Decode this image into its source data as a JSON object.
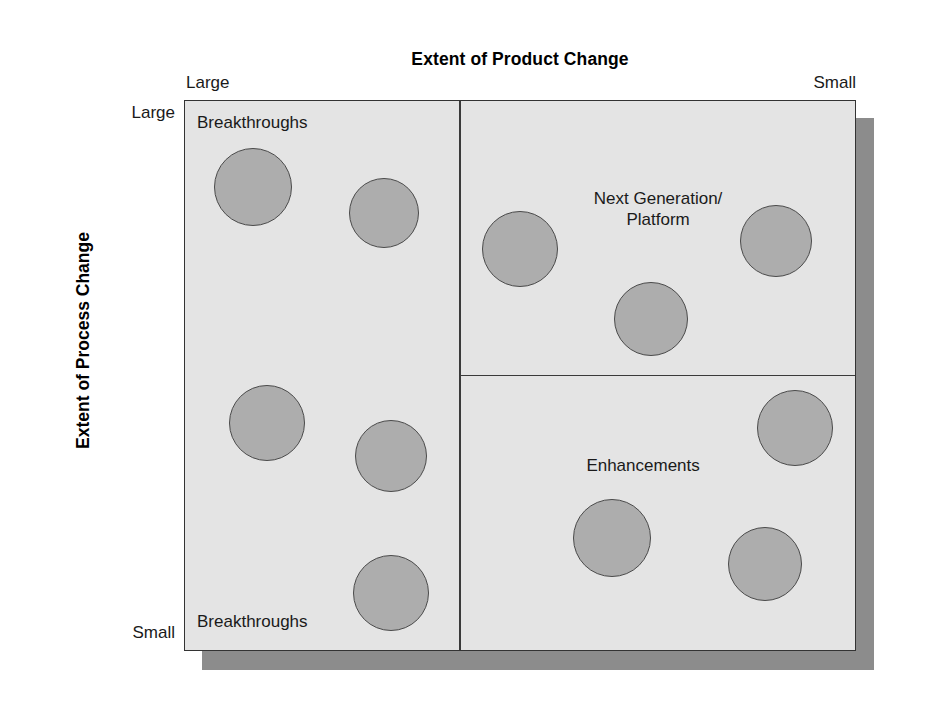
{
  "figure": {
    "background_color": "#ffffff",
    "frame_color": "#3a3a3a"
  },
  "axes": {
    "x": {
      "title": "Extent of Product Change",
      "left_label": "Large",
      "right_label": "Small"
    },
    "y": {
      "title": "Extent of Process Change",
      "top_label": "Large",
      "bottom_label": "Small"
    }
  },
  "matrix": {
    "background_color": "#e4e4e4",
    "border_color": "#333333",
    "shadow_color": "#8c8c8c",
    "vertical_divider_x_pct": 40.8,
    "horizontal_divider_y_pct": 49.7,
    "quadrants": [
      {
        "id": "top-left",
        "label": "Breakthroughs"
      },
      {
        "id": "top-right",
        "label": "Next Generation/\nPlatform"
      },
      {
        "id": "bottom-left",
        "label": "Breakthroughs"
      },
      {
        "id": "bottom-right",
        "label": "Enhancements"
      }
    ]
  },
  "chart_data": {
    "type": "scatter",
    "title": "Extent of Product Change",
    "xlabel": "Extent of Product Change",
    "ylabel": "Extent of Process Change",
    "xlim": [
      "Large",
      "Small"
    ],
    "ylim": [
      "Small",
      "Large"
    ],
    "grid": false,
    "legend": null,
    "annotations": [
      "Breakthroughs",
      "Next Generation/Platform",
      "Breakthroughs",
      "Enhancements"
    ],
    "marker_fill": "#adadad",
    "marker_stroke": "#4a4a4a",
    "points": [
      {
        "id": "p1",
        "quadrant": "top-left",
        "cx": 252,
        "cy": 186,
        "r": 39
      },
      {
        "id": "p2",
        "quadrant": "top-left",
        "cx": 383,
        "cy": 212,
        "r": 35
      },
      {
        "id": "p3",
        "quadrant": "top-right",
        "cx": 519,
        "cy": 248,
        "r": 38
      },
      {
        "id": "p4",
        "quadrant": "top-right",
        "cx": 775,
        "cy": 240,
        "r": 36
      },
      {
        "id": "p5",
        "quadrant": "top-right",
        "cx": 650,
        "cy": 318,
        "r": 37
      },
      {
        "id": "p6",
        "quadrant": "bottom-left",
        "cx": 266,
        "cy": 422,
        "r": 38
      },
      {
        "id": "p7",
        "quadrant": "bottom-left",
        "cx": 390,
        "cy": 455,
        "r": 36
      },
      {
        "id": "p8",
        "quadrant": "bottom-left",
        "cx": 390,
        "cy": 592,
        "r": 38
      },
      {
        "id": "p9",
        "quadrant": "bottom-right",
        "cx": 794,
        "cy": 427,
        "r": 38
      },
      {
        "id": "p10",
        "quadrant": "bottom-right",
        "cx": 611,
        "cy": 537,
        "r": 39
      },
      {
        "id": "p11",
        "quadrant": "bottom-right",
        "cx": 764,
        "cy": 563,
        "r": 37
      }
    ]
  }
}
